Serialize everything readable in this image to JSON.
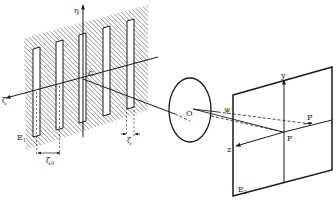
{
  "diagram": {
    "type": "optical-setup",
    "colors": {
      "ink": "#1a1a1a",
      "paper": "#ffffff",
      "hatch": "#4a4a4a"
    },
    "plane_e1": {
      "label": "E",
      "label_sub": "1",
      "axes": {
        "vertical": "η",
        "horizontal": "ζ"
      },
      "origin_label": "C",
      "slit_count": 5,
      "dimension_period": {
        "label": "ζ",
        "sub": "0"
      },
      "dimension_width": {
        "label": "ζ"
      }
    },
    "lens": {
      "label": "O"
    },
    "plane_e2": {
      "label": "E",
      "label_sub": "2",
      "axes": {
        "vertical": "y",
        "horizontal": "z"
      },
      "focus_label": "F",
      "point_label": "P",
      "angle_label": "ψ"
    }
  }
}
